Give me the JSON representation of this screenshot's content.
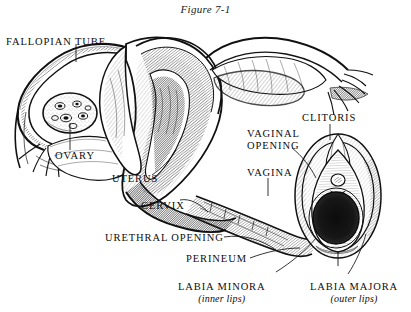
{
  "figure": {
    "title": "Figure 7-1",
    "background_color": "#ffffff",
    "ink_color": "#111111"
  },
  "labels": {
    "fallopian_tube": "FALLOPIAN TUBE",
    "ovary": "OVARY",
    "uterus": "UTERUS",
    "cervix": "CERVIX",
    "urethral_opening": "URETHRAL OPENING",
    "perineum": "PERINEUM",
    "labia_minora": "LABIA MINORA",
    "labia_minora_sub": "(inner lips)",
    "labia_majora": "LABIA MAJORA",
    "labia_majora_sub": "(outer lips)",
    "clitoris": "CLITORIS",
    "vaginal_opening_line1": "VAGINAL",
    "vaginal_opening_line2": "OPENING",
    "vagina": "VAGINA"
  }
}
